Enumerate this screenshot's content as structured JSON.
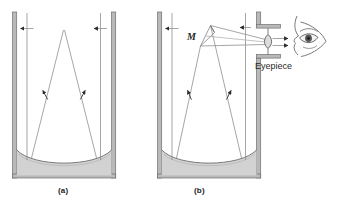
{
  "figure": {
    "background_color": "#ffffff",
    "panels": [
      {
        "id": "a",
        "caption": "(a)",
        "description": "Parallel rays enter a vertical tube and reflect from a concave rotating-mercury mirror, converging toward a focus near the top of the tube."
      },
      {
        "id": "b",
        "caption": "(b)",
        "description": "A small secondary mirror M intercepts the converging beam and directs it sideways through an eyepiece in the tube wall to the observer's eye."
      }
    ],
    "labels": {
      "mirror": "M",
      "eyepiece": "Eyepiece"
    },
    "colors": {
      "tube_wall_fill": "#b9b9b9",
      "tube_wall_stroke": "#6f6f6f",
      "liquid_fill": "#d0d0d0",
      "liquid_stroke": "#7a7a7a",
      "ray_stroke": "#8c8c8c",
      "arrow_fill": "#2b2b2b",
      "eye_stroke": "#555555",
      "lens_fill": "#d8d8d8",
      "caption_text": "#1b1b1b",
      "label_text": "#2a2a2a"
    },
    "elements": {
      "tube_a": "vertical-tube-a",
      "tube_b": "vertical-tube-b",
      "mercury_a": "liquid-mirror-a",
      "mercury_b": "liquid-mirror-b",
      "incoming_rays_a": 2,
      "incoming_rays_b": 2,
      "converging_rays_a": 2,
      "converging_rays_b": 2,
      "secondary_mirror": "secondary-mirror-M",
      "eyepiece_lens": "eyepiece-lens",
      "observer_eye": "observer-eye",
      "exit_rays": 2
    }
  }
}
